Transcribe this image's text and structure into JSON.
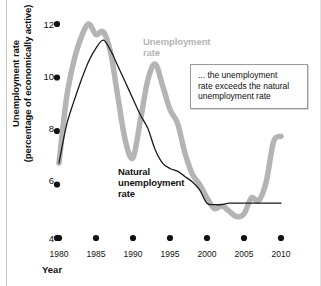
{
  "chart_data": {
    "type": "line",
    "title": "",
    "xlabel": "Year",
    "ylabel": "Unemployment rate (percentage of economically active)",
    "ylabel_line1": "Unemployment rate",
    "ylabel_line2": "(percentage of economically active)",
    "xlim": [
      1980,
      2010
    ],
    "ylim": [
      4,
      12.6
    ],
    "grid": false,
    "legend_position": "inline-annotations",
    "xticks": [
      1980,
      1985,
      1990,
      1995,
      2000,
      2005,
      2010
    ],
    "xtick_labels": [
      "1980",
      "1985",
      "1990",
      "1995",
      "2000",
      "2005",
      "2010"
    ],
    "yticks": [
      4,
      6,
      8,
      10,
      12
    ],
    "ytick_labels": [
      "4",
      "6",
      "8",
      "10",
      "12"
    ],
    "tick_marker": "filled-dot",
    "series": [
      {
        "name": "Unemployment rate",
        "color": "#b4b4b4",
        "width": 5.5,
        "x": [
          1980,
          1981,
          1982,
          1983,
          1984,
          1985,
          1986,
          1987,
          1988,
          1989,
          1990,
          1991,
          1992,
          1993,
          1994,
          1995,
          1996,
          1997,
          1998,
          1999,
          2000,
          2001,
          2002,
          2003,
          2004,
          2005,
          2006,
          2007,
          2008,
          2009,
          2010
        ],
        "values": [
          6.8,
          9.2,
          10.6,
          11.5,
          12.0,
          11.6,
          11.7,
          10.9,
          9.2,
          7.6,
          7.0,
          8.4,
          9.9,
          10.5,
          9.7,
          8.8,
          8.3,
          7.2,
          6.4,
          6.0,
          5.5,
          5.1,
          5.2,
          5.0,
          4.8,
          4.9,
          5.5,
          5.4,
          6.1,
          7.6,
          7.8
        ]
      },
      {
        "name": "Natural unemployment rate",
        "color": "#1a1a1a",
        "width": 1.3,
        "x": [
          1980,
          1981,
          1982,
          1983,
          1984,
          1985,
          1986,
          1987,
          1988,
          1989,
          1990,
          1991,
          1992,
          1993,
          1994,
          1995,
          1996,
          1997,
          1998,
          1999,
          2000,
          2001,
          2002,
          2003,
          2004,
          2005,
          2006,
          2007,
          2008,
          2009,
          2010
        ],
        "values": [
          6.8,
          8.2,
          9.1,
          9.9,
          10.6,
          11.1,
          11.4,
          11.0,
          10.4,
          9.8,
          9.2,
          8.6,
          8.1,
          7.3,
          6.8,
          6.6,
          6.5,
          6.3,
          6.1,
          5.8,
          5.3,
          5.25,
          5.25,
          5.3,
          5.3,
          5.3,
          5.3,
          5.3,
          5.3,
          5.3,
          5.3
        ]
      }
    ],
    "annotations": [
      {
        "name": "callout-box",
        "line1": "... the unemployment",
        "line2": "rate exceeds the natural",
        "line3": "unemployment rate"
      }
    ],
    "series_labels": [
      {
        "name": "unemployment-rate-label",
        "line1": "Unemployment",
        "line2": "rate"
      },
      {
        "name": "natural-rate-label",
        "line1": "Natural",
        "line2": "unemployment",
        "line3": "rate"
      }
    ]
  }
}
